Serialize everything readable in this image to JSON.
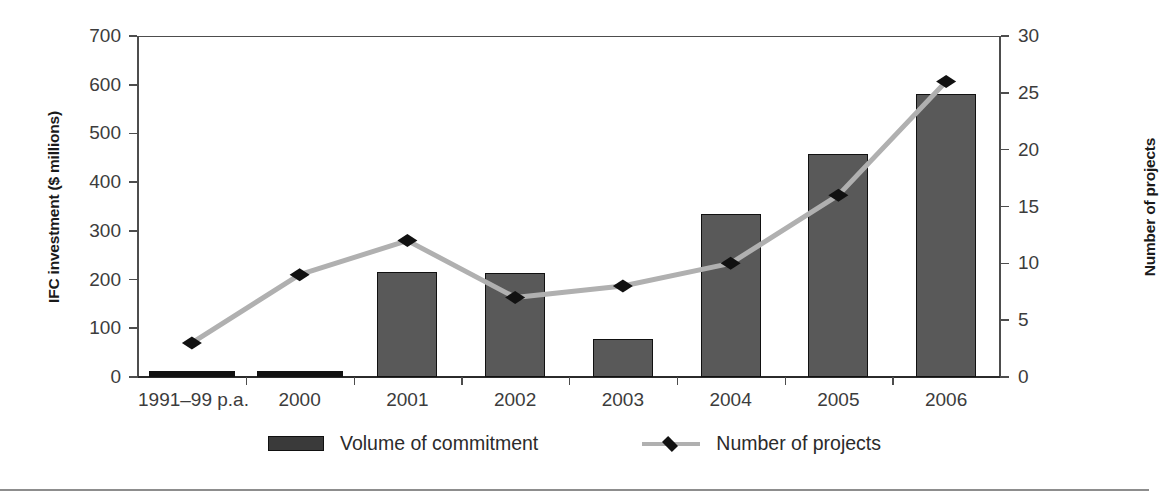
{
  "axes": {
    "left_title": "IFC investment ($ millions)",
    "right_title": "Number of projects",
    "left_ticks": [
      "700",
      "600",
      "500",
      "400",
      "300",
      "200",
      "100",
      "0"
    ],
    "right_ticks": [
      "30",
      "25",
      "20",
      "15",
      "10",
      "5",
      "0"
    ],
    "x_ticks": [
      "1991–99 p.a.",
      "2000",
      "2001",
      "2002",
      "2003",
      "2004",
      "2005",
      "2006"
    ]
  },
  "legend": {
    "items": [
      {
        "label": "Volume of commitment",
        "type": "bar",
        "color": "#3a3a3a"
      },
      {
        "label": "Number of projects",
        "type": "line",
        "color": "#b0b0b0",
        "marker_color": "#111111"
      }
    ]
  },
  "colors": {
    "bar_fill": "#595959",
    "bar_border": "#111111",
    "line": "#b0b0b0",
    "marker": "#111111",
    "axis": "#4d4d4d",
    "text": "#3c3c3c"
  },
  "chart_data": {
    "type": "bar",
    "title": "",
    "xlabel": "",
    "ylabel": "IFC investment ($ millions)",
    "y2label": "Number of projects",
    "ylim": [
      0,
      700
    ],
    "y2lim": [
      0,
      30
    ],
    "grid": false,
    "legend_position": "bottom",
    "categories": [
      "1991–99 p.a.",
      "2000",
      "2001",
      "2002",
      "2003",
      "2004",
      "2005",
      "2006"
    ],
    "series": [
      {
        "name": "Volume of commitment",
        "type": "bar",
        "axis": "left",
        "unit": "$ millions",
        "values": [
          5,
          9,
          216,
          214,
          78,
          334,
          458,
          581
        ]
      },
      {
        "name": "Number of projects",
        "type": "line",
        "axis": "right",
        "unit": "projects",
        "values": [
          3,
          9,
          12,
          7,
          8,
          10,
          16,
          26
        ]
      }
    ]
  }
}
